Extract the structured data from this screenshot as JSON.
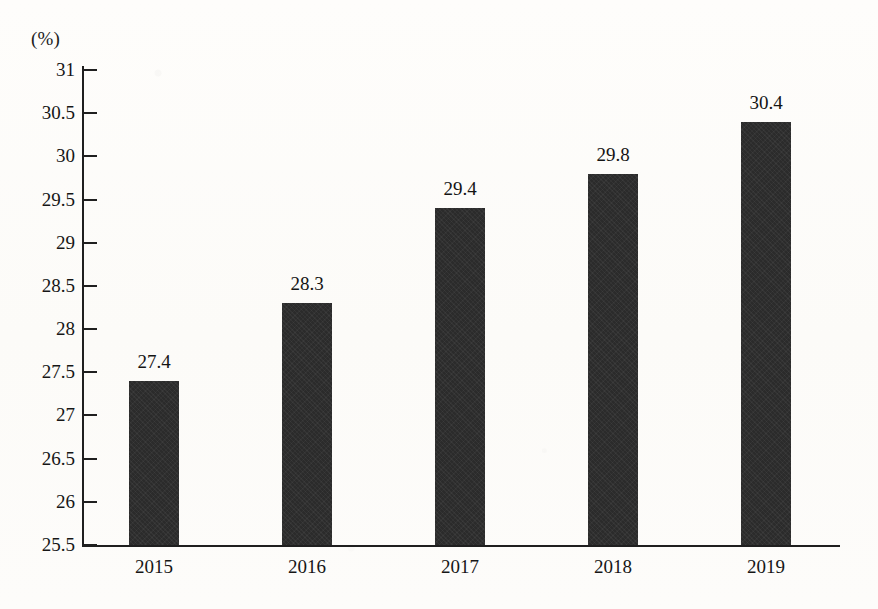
{
  "chart_data": {
    "type": "bar",
    "title": "",
    "subtitle": "",
    "xlabel": "",
    "ylabel": "",
    "unit_label": "(%)",
    "categories": [
      "2015",
      "2016",
      "2017",
      "2018",
      "2019"
    ],
    "values": [
      27.4,
      28.3,
      29.4,
      29.8,
      30.4
    ],
    "data_labels": [
      "27.4",
      "28.3",
      "29.4",
      "29.8",
      "30.4"
    ],
    "ylim": [
      25.5,
      31
    ],
    "ytick_step": 0.5,
    "ytick_labels": [
      "31",
      "30.5",
      "30",
      "29.5",
      "29",
      "28.5",
      "28",
      "27.5",
      "27",
      "26.5",
      "26",
      "25.5"
    ],
    "ytick_values": [
      31,
      30.5,
      30,
      29.5,
      29,
      28.5,
      28,
      27.5,
      27,
      26.5,
      26,
      25.5
    ],
    "grid": false,
    "legend": false,
    "legend_position": "none",
    "bar_color": "#2b2b2b",
    "axis_color": "#1f1f1f",
    "background_color": "#fdfcfa",
    "series": [
      {
        "name": "",
        "values": [
          27.4,
          28.3,
          29.4,
          29.8,
          30.4
        ]
      }
    ]
  }
}
